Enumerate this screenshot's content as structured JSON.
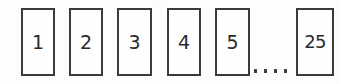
{
  "figure": {
    "name": "numbered-box-sequence",
    "background_color": "#fdfdfd",
    "border_color": "#3b3b3b",
    "text_color": "#2a2a2a",
    "cells": [
      {
        "label": "1",
        "x": 21,
        "y": 8,
        "width": 34,
        "height": 68
      },
      {
        "label": "2",
        "x": 69,
        "y": 8,
        "width": 34,
        "height": 68
      },
      {
        "label": "3",
        "x": 117,
        "y": 8,
        "width": 35,
        "height": 68
      },
      {
        "label": "4",
        "x": 167,
        "y": 8,
        "width": 34,
        "height": 68
      },
      {
        "label": "5",
        "x": 215,
        "y": 8,
        "width": 35,
        "height": 68
      },
      {
        "label": "25",
        "x": 296,
        "y": 8,
        "width": 38,
        "height": 68
      }
    ],
    "ellipsis": {
      "label": "....",
      "dot_count": 4,
      "x": 254,
      "y": 69,
      "width": 37
    }
  }
}
